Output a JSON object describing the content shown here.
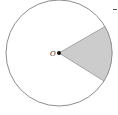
{
  "diagram": {
    "type": "circle-sector",
    "center_label": "O",
    "circle": {
      "cx": 59,
      "cy": 53,
      "r": 53,
      "stroke": "#6e6e6e"
    },
    "sector": {
      "start_deg": -30,
      "end_deg": 32,
      "fill": "#cccccc",
      "stroke": "#7a7a7a"
    },
    "center_dot_color": "#111111",
    "colors": {
      "background": "#ffffff"
    }
  }
}
